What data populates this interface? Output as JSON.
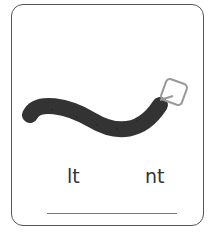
{
  "worksheet": {
    "picture": "belt",
    "options": [
      {
        "label": "lt"
      },
      {
        "label": "nt"
      }
    ],
    "answer_line": ""
  }
}
